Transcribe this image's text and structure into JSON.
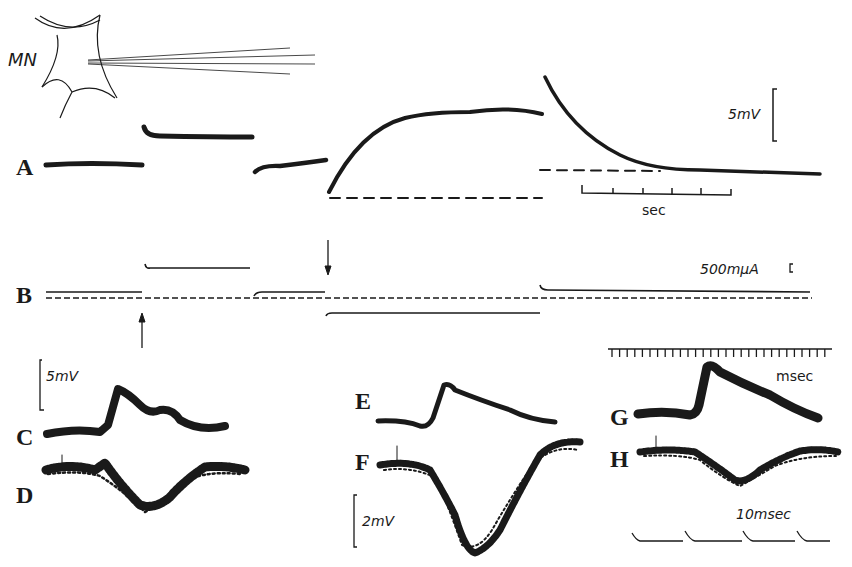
{
  "figure": {
    "cell_label": "MN",
    "panels": {
      "A": "A",
      "B": "B",
      "C": "C",
      "D": "D",
      "E": "E",
      "F": "F",
      "G": "G",
      "H": "H"
    },
    "scales": {
      "voltage_A": "5mV",
      "time_A": "sec",
      "current_B": "500mμA",
      "voltage_CD": "5mV",
      "voltage_F": "2mV",
      "time_G": "msec",
      "time_H": "10msec"
    },
    "colors": {
      "ink": "#1a1a1a",
      "background": "#ffffff"
    }
  }
}
